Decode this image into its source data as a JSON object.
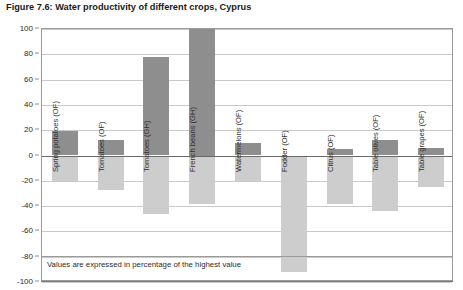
{
  "figure": {
    "title": "Figure 7.6: Water productivity of different crops, Cyprus",
    "footnote": "Values are expressed in percentage of the highest value"
  },
  "chart_data": {
    "type": "bar",
    "title": "Figure 7.6: Water productivity of different crops, Cyprus",
    "subtitle": "",
    "xlabel": "",
    "ylabel": "",
    "ylim": [
      -100,
      100
    ],
    "ytick_step": 20,
    "ytick_labels": [
      "100",
      "80",
      "60",
      "40",
      "20",
      "0",
      "-20",
      "-40",
      "-60",
      "-80",
      "-100"
    ],
    "ytick_values": [
      100,
      80,
      60,
      40,
      20,
      0,
      -20,
      -40,
      -60,
      -80,
      -100
    ],
    "grid": true,
    "legend": "none",
    "annotation": "Values are expressed in percentage of the highest value",
    "categories": [
      "Spring potatoes (OF)",
      "Tomatoes (OF)",
      "Tomatoes (GH)",
      "French beans (GH)",
      "Watermelons (OF)",
      "Fodder (OF)",
      "Citrus (OF)",
      "Table olives (OF)",
      "Table grapes (OF)"
    ],
    "series": [
      {
        "name": "Positive value",
        "color": "#8e8e8e",
        "values": [
          19,
          12,
          78,
          100,
          10,
          0,
          5,
          12,
          6
        ]
      },
      {
        "name": "Negative value",
        "color": "#cdcdcd",
        "values": [
          -20,
          -27,
          -46,
          -38,
          -20,
          -92,
          -38,
          -44,
          -25
        ]
      }
    ]
  }
}
